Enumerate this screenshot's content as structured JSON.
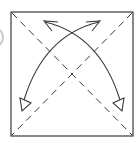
{
  "diagram": {
    "type": "origami-fold-instruction",
    "colors": {
      "line": "#3a3a3a",
      "background": "#ffffff",
      "edge_fragment": "#c8c8c8"
    },
    "square": {
      "x": 11,
      "y": 12,
      "width": 122,
      "height": 124
    },
    "fold_lines": [
      {
        "name": "diagonal-top-left-to-bottom-right",
        "style": "dashed"
      },
      {
        "name": "diagonal-top-right-to-bottom-left",
        "style": "dashed"
      }
    ],
    "arrows": [
      {
        "name": "arrow-bottom-right-to-top-left",
        "from": "bottom-right",
        "to": "top-left",
        "head_start": "hollow-triangle",
        "head_end": "open-v"
      },
      {
        "name": "arrow-bottom-left-to-top-right",
        "from": "bottom-left",
        "to": "top-right",
        "head_start": "hollow-triangle",
        "head_end": "open-v"
      }
    ]
  }
}
